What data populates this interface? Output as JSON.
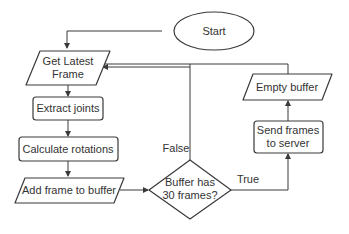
{
  "diagram": {
    "type": "flowchart",
    "nodes": {
      "start": {
        "label": "Start",
        "shape": "ellipse"
      },
      "get_frame": {
        "label_line1": "Get Latest",
        "label_line2": "Frame",
        "shape": "parallelogram"
      },
      "extract": {
        "label": "Extract joints",
        "shape": "rounded-rect"
      },
      "calc": {
        "label": "Calculate rotations",
        "shape": "rounded-rect"
      },
      "add": {
        "label": "Add frame to buffer",
        "shape": "parallelogram"
      },
      "decision": {
        "label_line1": "Buffer has",
        "label_line2": "30 frames?",
        "shape": "diamond"
      },
      "send": {
        "label_line1": "Send frames",
        "label_line2": "to server",
        "shape": "rounded-rect"
      },
      "empty": {
        "label": "Empty buffer",
        "shape": "parallelogram"
      }
    },
    "edge_labels": {
      "false": "False",
      "true": "True"
    },
    "edges": [
      {
        "from": "start",
        "to": "get_frame"
      },
      {
        "from": "get_frame",
        "to": "extract"
      },
      {
        "from": "extract",
        "to": "calc"
      },
      {
        "from": "calc",
        "to": "add"
      },
      {
        "from": "add",
        "to": "decision"
      },
      {
        "from": "decision",
        "to": "get_frame",
        "label": "False"
      },
      {
        "from": "decision",
        "to": "send",
        "label": "True"
      },
      {
        "from": "send",
        "to": "empty"
      },
      {
        "from": "empty",
        "to": "get_frame"
      }
    ],
    "colors": {
      "stroke": "#3a3a3a",
      "text": "#333333",
      "background": "#ffffff"
    }
  }
}
